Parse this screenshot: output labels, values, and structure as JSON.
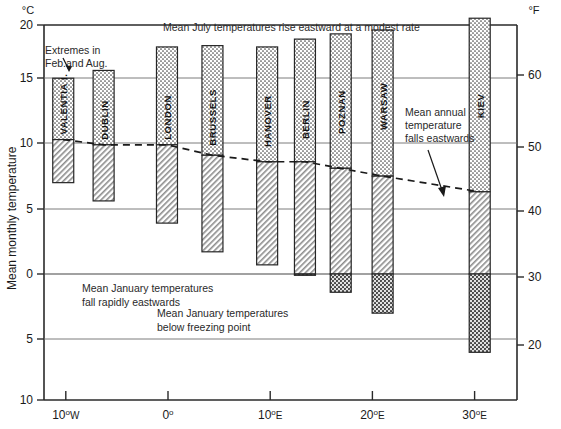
{
  "figure": {
    "y_axis_left_unit": "°C",
    "y_axis_right_unit": "°F",
    "y_axis_title": "Mean monthly temperature",
    "annotations": {
      "extremes": "Extremes in\nFeb.and Aug.",
      "extremes_line1": "Extremes in",
      "extremes_line2": "Feb.and Aug.",
      "july_note": "Mean July temperatures rise eastward at a modest rate",
      "annual_line1": "Mean annual",
      "annual_line2": "temperature",
      "annual_line3": "falls eastwards",
      "january_fall_line1": "Mean January temperatures",
      "january_fall_line2": "fall rapidly eastwards",
      "freezing_line1": "Mean January temperatures",
      "freezing_line2": "below freezing point"
    }
  },
  "chart_data": {
    "type": "bar",
    "title": "Mean July temperatures rise eastward at a modest rate",
    "xlabel": "Longitude",
    "ylabel": "Mean monthly temperature",
    "ylim": [
      -10,
      21
    ],
    "xlim_deg": [
      -14,
      34
    ],
    "grid": true,
    "legend": "none",
    "y_unit_left": "°C",
    "y_unit_right": "°F",
    "y_ticks_celsius": [
      {
        "value": 20,
        "label": "20"
      },
      {
        "value": 15,
        "label": "15"
      },
      {
        "value": 10,
        "label": "10"
      },
      {
        "value": 5,
        "label": "5"
      },
      {
        "value": 0,
        "label": "0"
      },
      {
        "value": -5,
        "label": "5"
      },
      {
        "value": -10,
        "label": "10"
      }
    ],
    "y_ticks_fahrenheit": [
      {
        "value": 60,
        "label": "60"
      },
      {
        "value": 50,
        "label": "50"
      },
      {
        "value": 40,
        "label": "40"
      },
      {
        "value": 30,
        "label": "30"
      },
      {
        "value": 20,
        "label": "20"
      }
    ],
    "x_ticks": [
      {
        "deg": -10,
        "num": "10",
        "sup": "o",
        "dir": "W"
      },
      {
        "deg": 0,
        "num": "0",
        "sup": "o",
        "dir": ""
      },
      {
        "deg": 10,
        "num": "10",
        "sup": "o",
        "dir": "E"
      },
      {
        "deg": 20,
        "num": "20",
        "sup": "o",
        "dir": "E"
      },
      {
        "deg": 30,
        "num": "30",
        "sup": "o",
        "dir": "E"
      }
    ],
    "categories": [
      "VALENTIA I.",
      "DUBLIN",
      "LONDON",
      "BRUSSELS",
      "HANOVER",
      "BERLIN",
      "POZNAN",
      "WARSAW",
      "KIEV"
    ],
    "series": [
      {
        "name": "August mean (bar top, °C)",
        "values": [
          15.0,
          15.6,
          17.4,
          17.5,
          17.4,
          18.0,
          18.4,
          18.7,
          19.6
        ]
      },
      {
        "name": "Mean annual (°C)",
        "values": [
          10.3,
          9.9,
          9.9,
          9.1,
          8.6,
          8.6,
          8.1,
          7.5,
          6.3
        ]
      },
      {
        "name": "February mean (bar bottom, °C)",
        "values": [
          7.0,
          5.6,
          3.9,
          1.7,
          0.7,
          -0.1,
          -1.4,
          -3.0,
          -6.0
        ]
      }
    ],
    "stations": [
      {
        "name": "VALENTIA I.",
        "lon": -10.25,
        "summer_max": 15.0,
        "annual_mean": 10.3,
        "winter_min": 7.0,
        "below_freezing": false
      },
      {
        "name": "DUBLIN",
        "lon": -6.3,
        "summer_max": 15.6,
        "annual_mean": 9.9,
        "winter_min": 5.6,
        "below_freezing": false
      },
      {
        "name": "LONDON",
        "lon": -0.1,
        "summer_max": 17.4,
        "annual_mean": 9.9,
        "winter_min": 3.9,
        "below_freezing": false
      },
      {
        "name": "BRUSSELS",
        "lon": 4.35,
        "summer_max": 17.5,
        "annual_mean": 9.1,
        "winter_min": 1.7,
        "below_freezing": false
      },
      {
        "name": "HANOVER",
        "lon": 9.7,
        "summer_max": 17.4,
        "annual_mean": 8.6,
        "winter_min": 0.7,
        "below_freezing": false
      },
      {
        "name": "BERLIN",
        "lon": 13.4,
        "summer_max": 18.0,
        "annual_mean": 8.6,
        "winter_min": -0.1,
        "below_freezing": true
      },
      {
        "name": "POZNAN",
        "lon": 16.9,
        "summer_max": 18.4,
        "annual_mean": 8.1,
        "winter_min": -1.4,
        "below_freezing": true
      },
      {
        "name": "WARSAW",
        "lon": 21.0,
        "summer_max": 18.7,
        "annual_mean": 7.5,
        "winter_min": -3.0,
        "below_freezing": true
      },
      {
        "name": "KIEV",
        "lon": 30.5,
        "summer_max": 19.6,
        "annual_mean": 6.3,
        "winter_min": -6.0,
        "below_freezing": true
      }
    ],
    "dashed_line_label": "Mean annual temperature falls eastwards"
  }
}
